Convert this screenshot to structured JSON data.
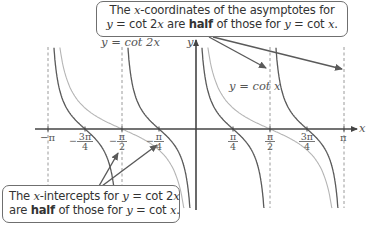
{
  "callouts": {
    "top": {
      "line1_pre": "The ",
      "line1_var": "x",
      "line1_post": "-coordinates of the asymptotes for",
      "line2_a": "y",
      "line2_b": " = cot 2",
      "line2_c": "x",
      "line2_d": " are ",
      "line2_bold": "half",
      "line2_e": " of those for ",
      "line2_f": "y",
      "line2_g": " = cot ",
      "line2_h": "x",
      "line2_i": "."
    },
    "bottom": {
      "line1_pre": "The ",
      "line1_var": "x",
      "line1_mid": "-intercepts for ",
      "line1_y": "y",
      "line1_eq": " = cot 2",
      "line1_x": "x",
      "line2_a": "are ",
      "line2_bold": "half",
      "line2_b": " of those for ",
      "line2_y": "y",
      "line2_eq": " = cot ",
      "line2_x": "x",
      "line2_end": "."
    }
  },
  "labels": {
    "curve_cot2x": "y = cot 2x",
    "curve_cotx": "y = cot x",
    "axis_x": "x",
    "axis_y": "y"
  },
  "colors": {
    "cot2x": "#5a5a5a",
    "cotx": "#b4b4b4",
    "axis": "#444444",
    "asymptote": "#9a9a9a",
    "arrow": "#5a5a5a"
  },
  "chart_data": {
    "type": "line",
    "title": "",
    "xlabel": "x",
    "ylabel": "y",
    "x_ticks": [
      "-π",
      "-3π/4",
      "-π/2",
      "-π/4",
      "π/4",
      "π/2",
      "3π/4",
      "π"
    ],
    "x_tick_values": [
      -3.14159,
      -2.35619,
      -1.5708,
      -0.7854,
      0.7854,
      1.5708,
      2.35619,
      3.14159
    ],
    "xlim": [
      -3.14159,
      3.14159
    ],
    "series": [
      {
        "name": "y = cot 2x",
        "function": "cot(2x)",
        "asymptotes": [
          "-π",
          "-π/2",
          "0",
          "π/2",
          "π"
        ],
        "x_intercepts": [
          "-3π/4",
          "-π/4",
          "π/4",
          "3π/4"
        ]
      },
      {
        "name": "y = cot x",
        "function": "cot(x)",
        "asymptotes": [
          "-π",
          "0",
          "π"
        ],
        "x_intercepts": [
          "-π/2",
          "π/2"
        ]
      }
    ],
    "grid": false,
    "legend": "inline labels"
  }
}
